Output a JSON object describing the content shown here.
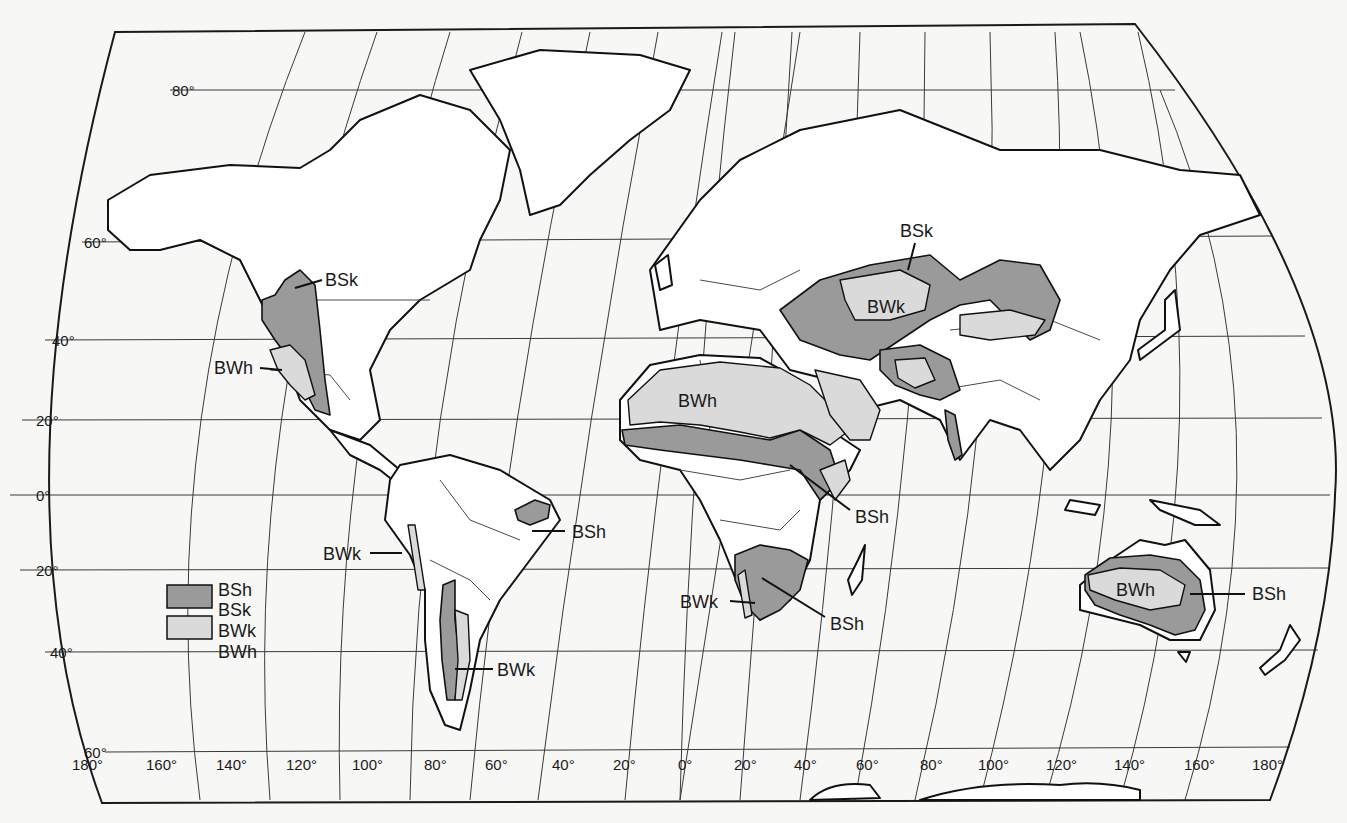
{
  "map": {
    "title": "Dry climates (B) world distribution",
    "colors": {
      "background": "#f7f7f5",
      "land": "#ffffff",
      "steppe_BS": "#9a9a9a",
      "desert_BW": "#dadada",
      "lines": "#111111"
    },
    "latitude_labels": [
      "80°",
      "60°",
      "40°",
      "20°",
      "0°",
      "-20°",
      "-40°",
      "-60°"
    ],
    "latitude_labels_display": [
      "80°",
      "60°",
      "40°",
      "20°",
      "0°",
      "20°",
      "40°",
      "60°"
    ],
    "longitude_labels": [
      "180°",
      "160°",
      "140°",
      "120°",
      "100°",
      "80°",
      "60°",
      "40°",
      "20°",
      "0°",
      "20°",
      "40°",
      "60°",
      "80°",
      "100°",
      "120°",
      "140°",
      "160°",
      "180°"
    ],
    "legend": {
      "items": [
        {
          "swatch": "dark",
          "labels": [
            "BSh",
            "BSk"
          ]
        },
        {
          "swatch": "light",
          "labels": [
            "BWk",
            "BWh"
          ]
        }
      ]
    },
    "region_labels": [
      {
        "text": "BSk",
        "region": "North America Great Plains"
      },
      {
        "text": "BWh",
        "region": "Southwestern North America"
      },
      {
        "text": "BWk",
        "region": "Peru / Atacama coast"
      },
      {
        "text": "BSh",
        "region": "Northeast Brazil"
      },
      {
        "text": "BWk",
        "region": "Patagonia"
      },
      {
        "text": "BWh",
        "region": "Sahara"
      },
      {
        "text": "BSh",
        "region": "East Africa / Horn"
      },
      {
        "text": "BWk",
        "region": "Namib / Southwest Africa"
      },
      {
        "text": "BSh",
        "region": "Kalahari / Southern Africa"
      },
      {
        "text": "BSk",
        "region": "Central Asian steppe"
      },
      {
        "text": "BWk",
        "region": "Central Asian desert"
      },
      {
        "text": "BWh",
        "region": "Australian interior"
      },
      {
        "text": "BSh",
        "region": "Australian margins"
      }
    ]
  }
}
